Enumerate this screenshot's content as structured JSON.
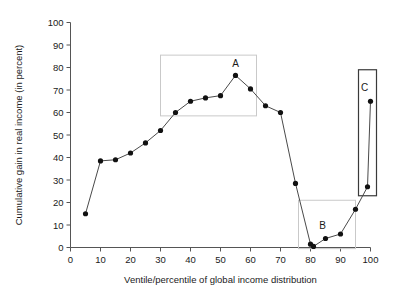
{
  "chart_data": {
    "type": "line",
    "title": "",
    "partial_title_fragment": "",
    "xlabel": "Ventile/percentile of global income distribution",
    "ylabel": "Cumulative gain in real income (in percent)",
    "xlim": [
      0,
      100
    ],
    "ylim": [
      0,
      100
    ],
    "xticks": [
      0,
      10,
      20,
      30,
      40,
      50,
      60,
      70,
      80,
      90,
      100
    ],
    "yticks": [
      0,
      10,
      20,
      30,
      40,
      50,
      60,
      70,
      80,
      90,
      100
    ],
    "xtick_labels": [
      "0",
      "10",
      "20",
      "30",
      "40",
      "50",
      "60",
      "70",
      "80",
      "90",
      "100"
    ],
    "ytick_labels": [
      "0",
      "10",
      "20",
      "30",
      "40",
      "50",
      "60",
      "70",
      "80",
      "90",
      "100"
    ],
    "grid": false,
    "legend": null,
    "series": [
      {
        "name": "Cumulative gain in real income",
        "marker": "filled-circle",
        "color": "#111111",
        "x": [
          5,
          10,
          15,
          20,
          25,
          30,
          35,
          40,
          45,
          50,
          55,
          60,
          65,
          70,
          75,
          80,
          81,
          85,
          90,
          95,
          99,
          100
        ],
        "y": [
          15,
          38.5,
          39,
          42,
          46.5,
          52,
          60,
          65,
          66.5,
          67.5,
          76.5,
          70.5,
          63,
          60,
          28.5,
          1.5,
          0.5,
          4,
          6,
          17,
          27,
          65
        ]
      }
    ],
    "annotations": [
      {
        "label": "A",
        "label_x": 55,
        "label_y": 82,
        "box": {
          "x0": 30,
          "x1": 62,
          "y0": 58.5,
          "y1": 85.5
        },
        "box_style": "light"
      },
      {
        "label": "B",
        "label_x": 84,
        "label_y": 10,
        "box": {
          "x0": 76,
          "x1": 95,
          "y0": -0.5,
          "y1": 21
        },
        "box_style": "light"
      },
      {
        "label": "C",
        "label_x": 98,
        "label_y": 71,
        "box": {
          "x0": 96,
          "x1": 102,
          "y0": 23,
          "y1": 79
        },
        "box_style": "dark"
      }
    ]
  }
}
